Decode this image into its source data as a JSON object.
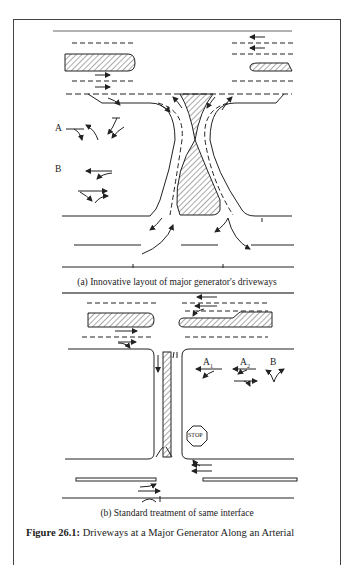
{
  "figure": {
    "number_label": "Figure 26.1:",
    "title": "Driveways at a Major Generator Along an Arterial"
  },
  "panel_a": {
    "caption": "(a) Innovative layout of major generator's driveways",
    "labels": {
      "a": "A",
      "b": "B"
    }
  },
  "panel_b": {
    "caption": "(b) Standard treatment of same interface",
    "labels": {
      "a1": "A",
      "a1_sub": "1",
      "a2": "A",
      "a2_sub": "2",
      "b": "B"
    },
    "stop_sign": "STOP"
  },
  "colors": {
    "line": "#222222",
    "hatch": "#555555",
    "frame": "#444444"
  }
}
